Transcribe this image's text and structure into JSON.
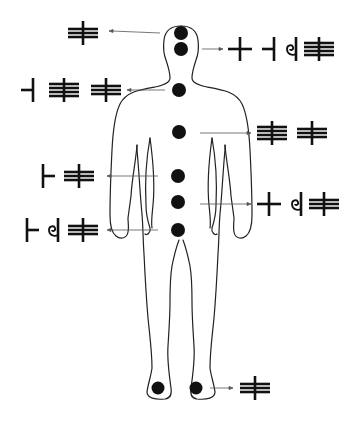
{
  "diagram": {
    "title": "",
    "figure": "human-body-outline",
    "colors": {
      "ink": "#111111",
      "line": "#222222",
      "arrow": "#555555",
      "background": "#ffffff"
    },
    "glyph_types": {
      "cross": "horizontal bar crossed by vertical bar",
      "left-tick": "horizontal bar meeting vertical bar on right (┤)",
      "right-tick": "vertical bar with horizontal bar extending right (├)",
      "spiral-bar": "spiral curl joined to vertical bar",
      "three-lines": "three horizontal bars crossed by vertical bar",
      "four-lines": "four horizontal bars crossed by vertical bar"
    },
    "points": [
      {
        "id": "crown",
        "dot": [
          181,
          33
        ],
        "direction": "left",
        "arrow": [
          160,
          109
        ],
        "glyph_pos": [
          63,
          20
        ],
        "glyphs": [
          "three-lines"
        ]
      },
      {
        "id": "forehead",
        "dot": [
          181,
          49
        ],
        "direction": "right",
        "arrow": [
          202,
          222
        ],
        "glyph_pos": [
          228,
          36
        ],
        "glyphs": [
          "cross",
          "left-tick",
          "spiral-bar",
          "four-lines"
        ]
      },
      {
        "id": "throat",
        "dot": [
          179,
          90
        ],
        "direction": "left",
        "arrow": [
          160,
          126
        ],
        "glyph_pos": [
          20,
          77
        ],
        "glyphs": [
          "left-tick",
          "four-lines",
          "three-lines"
        ]
      },
      {
        "id": "chest",
        "dot": [
          179,
          132
        ],
        "direction": "right",
        "arrow": [
          200,
          250
        ],
        "glyph_pos": [
          256,
          119
        ],
        "glyphs": [
          "four-lines",
          "three-lines"
        ]
      },
      {
        "id": "solar-plexus",
        "dot": [
          178,
          176
        ],
        "direction": "left",
        "arrow": [
          158,
          108
        ],
        "glyph_pos": [
          36,
          163
        ],
        "glyphs": [
          "right-tick",
          "three-lines"
        ]
      },
      {
        "id": "navel",
        "dot": [
          178,
          202
        ],
        "direction": "right",
        "arrow": [
          200,
          250
        ],
        "glyph_pos": [
          256,
          191
        ],
        "glyphs": [
          "cross",
          "spiral-bar",
          "three-lines"
        ]
      },
      {
        "id": "groin",
        "dot": [
          178,
          230
        ],
        "direction": "left",
        "arrow": [
          158,
          108
        ],
        "glyph_pos": [
          24,
          217
        ],
        "glyphs": [
          "right-tick",
          "spiral-bar",
          "three-lines"
        ]
      },
      {
        "id": "feet",
        "dot": [
          196,
          388
        ],
        "extra_dot": [
          158,
          388
        ],
        "direction": "right",
        "arrow": [
          210,
          232
        ],
        "glyph_pos": [
          238,
          375
        ],
        "glyphs": [
          "three-lines"
        ]
      }
    ]
  }
}
